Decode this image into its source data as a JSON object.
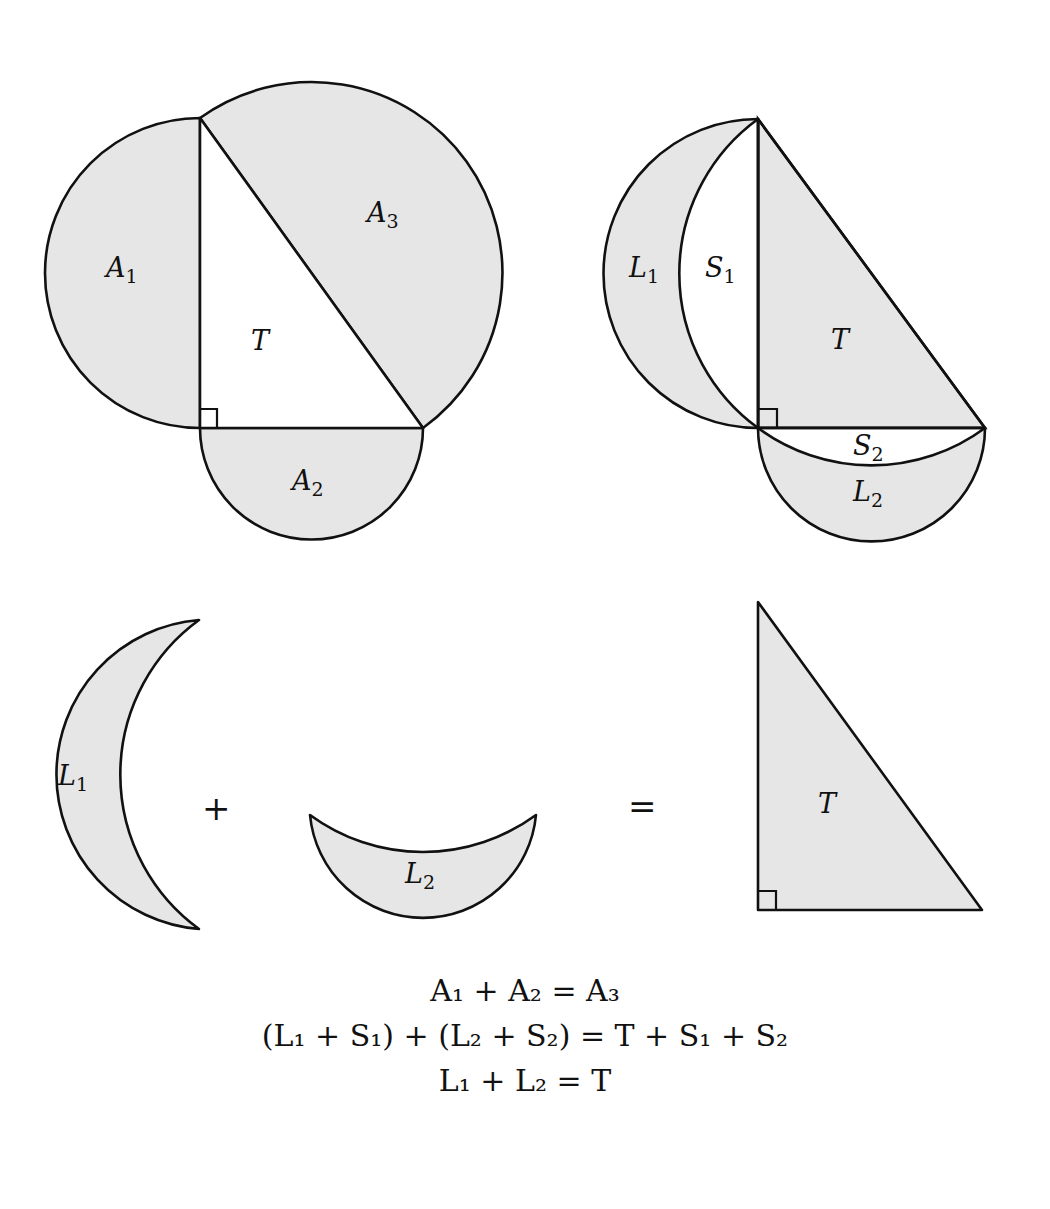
{
  "figure": {
    "panel_top_left": {
      "labels": {
        "a1": {
          "base": "A",
          "sub": "1"
        },
        "a2": {
          "base": "A",
          "sub": "2"
        },
        "a3": {
          "base": "A",
          "sub": "3"
        },
        "t": {
          "base": "T",
          "sub": ""
        }
      }
    },
    "panel_top_right": {
      "labels": {
        "l1": {
          "base": "L",
          "sub": "1"
        },
        "s1": {
          "base": "S",
          "sub": "1"
        },
        "t": {
          "base": "T",
          "sub": ""
        },
        "s2": {
          "base": "S",
          "sub": "2"
        },
        "l2": {
          "base": "L",
          "sub": "2"
        }
      }
    },
    "panel_bottom": {
      "labels": {
        "l1": {
          "base": "L",
          "sub": "1"
        },
        "l2": {
          "base": "L",
          "sub": "2"
        },
        "t": {
          "base": "T",
          "sub": ""
        }
      },
      "plus": "+",
      "equals": "="
    },
    "colors": {
      "fill": "#e6e6e6",
      "stroke": "#111111",
      "background": "#ffffff"
    }
  },
  "equations": [
    "A₁ + A₂ = A₃",
    "(L₁ + S₁) + (L₂ + S₂) = T + S₁ + S₂",
    "L₁ + L₂ = T"
  ]
}
